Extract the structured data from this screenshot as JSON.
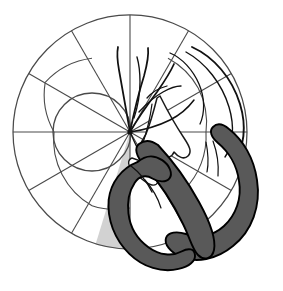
{
  "figure": {
    "title": "Polar fundus grid with vessel tracing and hairpin band",
    "width": 283,
    "height": 291,
    "background": "#ffffff"
  },
  "colors": {
    "stroke_grid": "#4a4a4a",
    "stroke_outline": "#1a1a1a",
    "stroke_vessel": "#111111",
    "band_fill": "#595959",
    "band_stroke": "#000000",
    "wedge_fill": "#d2d2d2",
    "center_dot": "#111111",
    "paper": "#ffffff"
  },
  "geometry": {
    "center": {
      "x": 130,
      "y": 132
    },
    "outer_circle": {
      "cx": 130,
      "cy": 132,
      "r": 117
    },
    "inner_circle": {
      "cx": 92,
      "cy": 132,
      "r": 39
    },
    "spoke_count": 12,
    "spoke_step_degrees": 30,
    "spoke_angles": [
      0,
      30,
      60,
      90,
      120,
      150,
      180,
      210,
      240,
      270,
      300,
      330
    ],
    "mid_arc_radius": 76,
    "center_dot_radius": 2.6
  },
  "chart_data": {
    "type": "scatter",
    "title": "Polar fundus grid with vessel tracing and hairpin band",
    "xlabel": "",
    "ylabel": "",
    "grid": true,
    "legend": null,
    "polar": {
      "radial_ticks": [
        39,
        76,
        117
      ],
      "angular_ticks_deg": [
        0,
        30,
        60,
        90,
        120,
        150,
        180,
        210,
        240,
        270,
        300,
        330
      ]
    },
    "annotations": [
      {
        "name": "shaded-wedge",
        "type": "sector",
        "start_deg": 252,
        "end_deg": 276,
        "radius": 117,
        "fill": "#d2d2d2"
      },
      {
        "name": "hairpin-band",
        "type": "band",
        "fill": "#595959",
        "stroke_width": 2
      },
      {
        "name": "scalloped-lobe",
        "type": "outline",
        "fill": "#ffffff"
      }
    ],
    "series": []
  },
  "elements": {
    "outer_circle_label": "outer boundary circle",
    "inner_circle_label": "inner offset circle",
    "spokes_label": "radial spoke lines",
    "mid_arcs_label": "intermediate arc segments",
    "wedge_label": "shaded sector wedge",
    "vessels_label": "branching vessel curves",
    "lobe_label": "scalloped lobed structure",
    "band_label": "thick hairpin band",
    "center_label": "center point marker"
  }
}
